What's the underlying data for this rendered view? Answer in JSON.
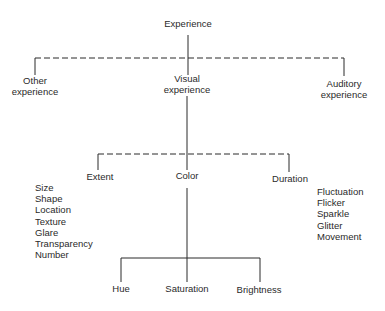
{
  "root": {
    "label": "Experience"
  },
  "level1": [
    {
      "id": "other",
      "line1": "Other",
      "line2": "experience"
    },
    {
      "id": "visual",
      "line1": "Visual",
      "line2": "experience"
    },
    {
      "id": "auditory",
      "line1": "Auditory",
      "line2": "experience"
    }
  ],
  "level2": [
    {
      "id": "extent",
      "label": "Extent"
    },
    {
      "id": "color",
      "label": "Color"
    },
    {
      "id": "duration",
      "label": "Duration"
    }
  ],
  "extent_attributes": [
    "Size",
    "Shape",
    "Location",
    "Texture",
    "Glare",
    "Transparency",
    "Number"
  ],
  "duration_attributes": [
    "Fluctuation",
    "Flicker",
    "Sparkle",
    "Glitter",
    "Movement"
  ],
  "level3": [
    {
      "id": "hue",
      "label": "Hue"
    },
    {
      "id": "saturation",
      "label": "Saturation"
    },
    {
      "id": "brightness",
      "label": "Brightness"
    }
  ],
  "edges": {
    "root_to_level1": "dashed",
    "visual_to_level2": "dashed",
    "color_to_level3": "solid"
  },
  "caption": {
    "text": ""
  },
  "colors": {
    "line": "#2a2a2a",
    "text": "#2a2a2a",
    "background": "#ffffff"
  }
}
